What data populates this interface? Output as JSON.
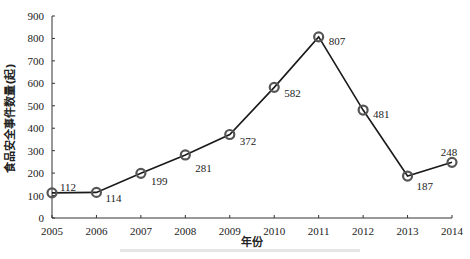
{
  "chart_data": {
    "type": "line",
    "title": "",
    "xlabel": "年份",
    "ylabel": "食品安全事件数量(起)",
    "categories": [
      "2005",
      "2006",
      "2007",
      "2008",
      "2009",
      "2010",
      "2011",
      "2012",
      "2013",
      "2014"
    ],
    "series": [
      {
        "name": "食品安全事件数量",
        "values": [
          112,
          114,
          199,
          281,
          372,
          582,
          807,
          481,
          187,
          248
        ]
      }
    ],
    "data_labels": [
      "112",
      "114",
      "199",
      "281",
      "372",
      "582",
      "807",
      "481",
      "187",
      "248"
    ],
    "yticks": [
      0,
      100,
      200,
      300,
      400,
      500,
      600,
      700,
      800,
      900
    ],
    "ylim": [
      0,
      900
    ],
    "grid": false,
    "legend": "none",
    "marker": "open-circle",
    "line_color": "#1a1a1a",
    "marker_color": "#555555"
  }
}
